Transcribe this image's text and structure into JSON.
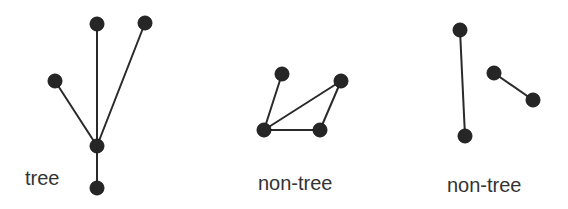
{
  "colors": {
    "node": "#262626",
    "edge": "#2a2a2a",
    "label": "#333333",
    "background": "#ffffff"
  },
  "graphs": [
    {
      "id": "graph-tree",
      "label": "tree",
      "label_pos": [
        25,
        185
      ],
      "nodes": [
        [
          97,
          24
        ],
        [
          145,
          23
        ],
        [
          55,
          81
        ],
        [
          97,
          146
        ],
        [
          97,
          188
        ]
      ],
      "edges": [
        [
          0,
          3
        ],
        [
          1,
          3
        ],
        [
          2,
          3
        ],
        [
          3,
          4
        ]
      ]
    },
    {
      "id": "graph-non-tree-cycle",
      "label": "non-tree",
      "label_pos": [
        258,
        190
      ],
      "nodes": [
        [
          282,
          74
        ],
        [
          341,
          81
        ],
        [
          264,
          130
        ],
        [
          320,
          130
        ]
      ],
      "edges": [
        [
          0,
          2
        ],
        [
          1,
          2
        ],
        [
          1,
          3
        ],
        [
          2,
          3
        ]
      ]
    },
    {
      "id": "graph-non-tree-disconnected",
      "label": "non-tree",
      "label_pos": [
        447,
        192
      ],
      "nodes": [
        [
          460,
          30
        ],
        [
          465,
          136
        ],
        [
          494,
          73
        ],
        [
          533,
          100
        ]
      ],
      "edges": [
        [
          0,
          1
        ],
        [
          2,
          3
        ]
      ]
    }
  ],
  "node_radius": 7
}
